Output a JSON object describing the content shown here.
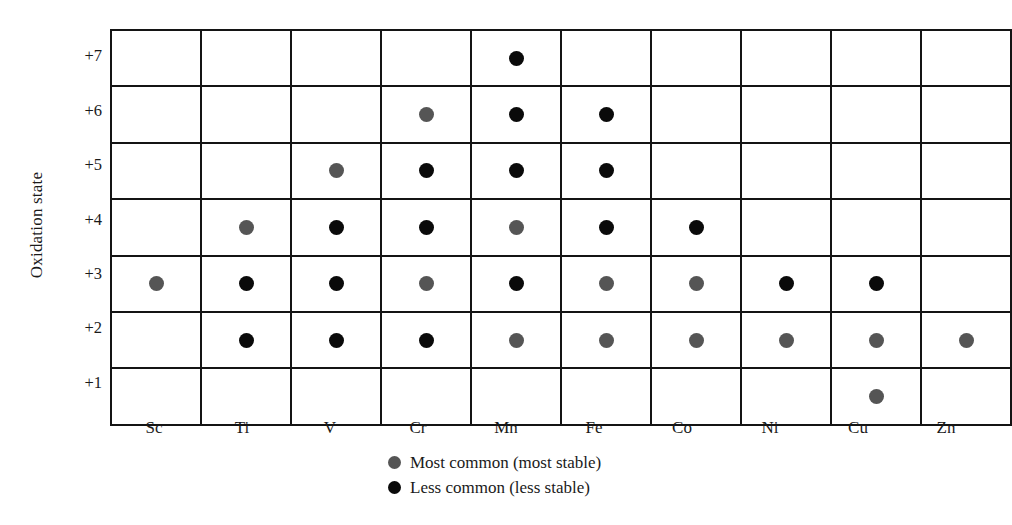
{
  "chart_data": {
    "type": "heatmap",
    "title": "",
    "xlabel": "",
    "ylabel": "Oxidation state",
    "grid": true,
    "legend_position": "bottom-center",
    "categories": [
      "Sc",
      "Ti",
      "V",
      "Cr",
      "Mn",
      "Fe",
      "Co",
      "Ni",
      "Cu",
      "Zn"
    ],
    "oxidation_states": [
      "+7",
      "+6",
      "+5",
      "+4",
      "+3",
      "+2",
      "+1"
    ],
    "marker_types": {
      "most": "Most common (most stable)",
      "less": "Less common (less stable)"
    },
    "marker_colors": {
      "most": "#555555",
      "less": "#0a0a0a"
    },
    "cells": [
      {
        "state": "+7",
        "values": [
          null,
          null,
          null,
          null,
          "less",
          null,
          null,
          null,
          null,
          null
        ]
      },
      {
        "state": "+6",
        "values": [
          null,
          null,
          null,
          "most",
          "less",
          "less",
          null,
          null,
          null,
          null
        ]
      },
      {
        "state": "+5",
        "values": [
          null,
          null,
          "most",
          "less",
          "less",
          "less",
          null,
          null,
          null,
          null
        ]
      },
      {
        "state": "+4",
        "values": [
          null,
          "most",
          "less",
          "less",
          "most",
          "less",
          "less",
          null,
          null,
          null
        ]
      },
      {
        "state": "+3",
        "values": [
          "most",
          "less",
          "less",
          "most",
          "less",
          "most",
          "most",
          "less",
          "less",
          null
        ]
      },
      {
        "state": "+2",
        "values": [
          null,
          "less",
          "less",
          "less",
          "most",
          "most",
          "most",
          "most",
          "most",
          "most"
        ]
      },
      {
        "state": "+1",
        "values": [
          null,
          null,
          null,
          null,
          null,
          null,
          null,
          null,
          "most",
          null
        ]
      }
    ]
  },
  "axes": {
    "y_title": "Oxidation state",
    "y_ticks": [
      "+7",
      "+6",
      "+5",
      "+4",
      "+3",
      "+2",
      "+1"
    ],
    "x_ticks": [
      "Sc",
      "Ti",
      "V",
      "Cr",
      "Mn",
      "Fe",
      "Co",
      "Ni",
      "Cu",
      "Zn"
    ]
  },
  "legend": {
    "items": [
      {
        "marker": "most",
        "label": "Most common (most stable)"
      },
      {
        "marker": "less",
        "label": "Less common (less stable)"
      }
    ]
  }
}
